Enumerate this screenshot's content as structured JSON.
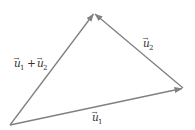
{
  "diagram": {
    "type": "vector-triangle",
    "line_color": "#808080",
    "text_color": "#333333",
    "vertices": {
      "origin": [
        10,
        125
      ],
      "right": [
        183,
        88
      ],
      "top": [
        94,
        13
      ]
    },
    "vectors": [
      {
        "id": "u1",
        "from": "origin",
        "to": "right",
        "label_base": "u",
        "label_sub": "1",
        "label_pos": [
          92,
          120
        ]
      },
      {
        "id": "u2",
        "from": "right",
        "to": "top",
        "label_base": "u",
        "label_sub": "2",
        "label_pos": [
          143,
          46
        ]
      },
      {
        "id": "u1_plus_u2",
        "from": "origin",
        "to": "top",
        "label_pos": [
          14,
          67
        ]
      }
    ],
    "labels": {
      "u1": {
        "base": "u",
        "sub": "1"
      },
      "u2": {
        "base": "u",
        "sub": "2"
      },
      "sum": {
        "a_base": "u",
        "a_sub": "1",
        "op": "+",
        "b_base": "u",
        "b_sub": "2"
      },
      "arrow": "→"
    }
  }
}
